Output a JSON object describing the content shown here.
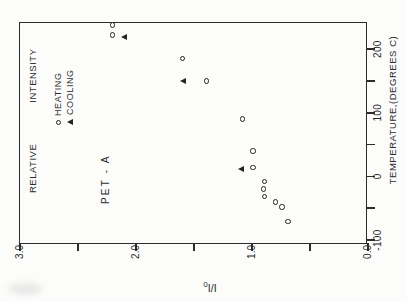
{
  "figure": {
    "paper_color": "#fcfcfb",
    "ink_color": "#2d2d2d",
    "rotation_degrees": -90
  },
  "chart_data": {
    "type": "scatter",
    "title": "",
    "sample_label": "PET - A",
    "legend_title": "RELATIVE INTENSITY",
    "legend_position": "upper-left-inside",
    "xlabel": "TEMPERATURE,(DEGREES C)",
    "ylabel": "I/I0",
    "ylabel_main": "I/I",
    "ylabel_sub": "0",
    "xlim": [
      -104.7,
      244.3
    ],
    "ylim": [
      0,
      3
    ],
    "grid": false,
    "x_ticks": [
      {
        "value": -100,
        "label": "-100"
      },
      {
        "value": -50,
        "label": ""
      },
      {
        "value": 0,
        "label": "0"
      },
      {
        "value": 50,
        "label": ""
      },
      {
        "value": 100,
        "label": "100"
      },
      {
        "value": 150,
        "label": ""
      },
      {
        "value": 200,
        "label": "200"
      }
    ],
    "y_ticks": [
      {
        "value": 0.0,
        "label": "0.0"
      },
      {
        "value": 0.5,
        "label": ""
      },
      {
        "value": 1.0,
        "label": "1.0"
      },
      {
        "value": 1.5,
        "label": ""
      },
      {
        "value": 2.0,
        "label": "2.0"
      },
      {
        "value": 2.5,
        "label": ""
      },
      {
        "value": 3.0,
        "label": "3.0"
      }
    ],
    "series": [
      {
        "name": "HEATING",
        "marker": "open-circle",
        "points": [
          [
            -71,
            0.69
          ],
          [
            -48,
            0.74
          ],
          [
            -40,
            0.8
          ],
          [
            -32,
            0.89
          ],
          [
            -20,
            0.9
          ],
          [
            -8,
            0.89
          ],
          [
            14,
            0.99
          ],
          [
            40,
            0.99
          ],
          [
            90,
            1.08
          ],
          [
            150,
            1.39
          ],
          [
            185,
            1.6
          ],
          [
            222,
            2.2
          ],
          [
            238,
            2.2
          ]
        ]
      },
      {
        "name": "COOLING",
        "marker": "filled-triangle",
        "points": [
          [
            13,
            1.09
          ],
          [
            151,
            1.59
          ],
          [
            221,
            2.1
          ]
        ]
      }
    ]
  }
}
